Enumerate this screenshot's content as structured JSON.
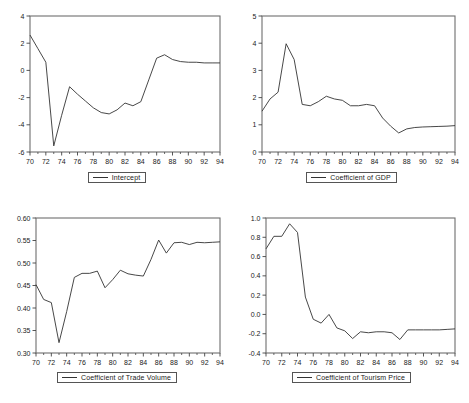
{
  "figure": {
    "layout": "2x2 grid of line charts",
    "panels": [
      "intercept",
      "gdp",
      "trade_volume",
      "tourism_price"
    ]
  },
  "chart_data": [
    {
      "id": "intercept",
      "type": "line",
      "title": "",
      "xlabel": "",
      "ylabel": "",
      "legend": "Intercept",
      "legend_position": "bottom-center",
      "grid": false,
      "xlim": [
        70,
        94
      ],
      "ylim": [
        -6,
        4
      ],
      "yticks": [
        -6,
        -4,
        -2,
        0,
        2,
        4
      ],
      "ytick_labels": [
        "-6",
        "-4",
        "-2",
        "0",
        "2",
        "4"
      ],
      "xticks": [
        70,
        72,
        74,
        76,
        78,
        80,
        82,
        84,
        86,
        88,
        90,
        92,
        94
      ],
      "xtick_labels": [
        "70",
        "72",
        "74",
        "76",
        "78",
        "80",
        "82",
        "84",
        "86",
        "88",
        "90",
        "92",
        "94"
      ],
      "x": [
        70,
        71,
        72,
        73,
        74,
        75,
        76,
        77,
        78,
        79,
        80,
        81,
        82,
        83,
        84,
        85,
        86,
        87,
        88,
        89,
        90,
        91,
        92,
        93,
        94
      ],
      "values": [
        2.6,
        1.6,
        0.6,
        -5.55,
        -3.3,
        -1.2,
        -1.75,
        -2.25,
        -2.75,
        -3.1,
        -3.2,
        -2.9,
        -2.4,
        -2.6,
        -2.3,
        -0.7,
        0.9,
        1.15,
        0.8,
        0.65,
        0.6,
        0.6,
        0.55,
        0.55,
        0.55
      ]
    },
    {
      "id": "gdp",
      "type": "line",
      "title": "",
      "xlabel": "",
      "ylabel": "",
      "legend": "Coefficient of GDP",
      "legend_position": "bottom-center",
      "grid": false,
      "xlim": [
        70,
        94
      ],
      "ylim": [
        0,
        5
      ],
      "yticks": [
        0,
        1,
        2,
        3,
        4,
        5
      ],
      "ytick_labels": [
        "0",
        "1",
        "2",
        "3",
        "4",
        "5"
      ],
      "xticks": [
        70,
        72,
        74,
        76,
        78,
        80,
        82,
        84,
        86,
        88,
        90,
        92,
        94
      ],
      "xtick_labels": [
        "70",
        "72",
        "74",
        "76",
        "78",
        "80",
        "82",
        "84",
        "86",
        "88",
        "90",
        "92",
        "94"
      ],
      "x": [
        70,
        71,
        72,
        73,
        74,
        75,
        76,
        77,
        78,
        79,
        80,
        81,
        82,
        83,
        84,
        85,
        86,
        87,
        88,
        89,
        90,
        91,
        92,
        93,
        94
      ],
      "values": [
        1.5,
        1.95,
        2.2,
        3.98,
        3.4,
        1.75,
        1.7,
        1.85,
        2.05,
        1.95,
        1.9,
        1.7,
        1.7,
        1.75,
        1.7,
        1.25,
        0.95,
        0.7,
        0.85,
        0.9,
        0.92,
        0.93,
        0.94,
        0.95,
        0.97
      ]
    },
    {
      "id": "trade_volume",
      "type": "line",
      "title": "",
      "xlabel": "",
      "ylabel": "",
      "legend": "Coefficient of Trade Volume",
      "legend_position": "bottom-center",
      "grid": false,
      "xlim": [
        70,
        94
      ],
      "ylim": [
        0.3,
        0.6
      ],
      "yticks": [
        0.3,
        0.35,
        0.4,
        0.45,
        0.5,
        0.55,
        0.6
      ],
      "ytick_labels": [
        "0.30",
        "0.35",
        "0.40",
        "0.45",
        "0.50",
        "0.55",
        "0.60"
      ],
      "xticks": [
        70,
        72,
        74,
        76,
        78,
        80,
        82,
        84,
        86,
        88,
        90,
        92,
        94
      ],
      "xtick_labels": [
        "70",
        "72",
        "74",
        "76",
        "78",
        "80",
        "82",
        "84",
        "86",
        "88",
        "90",
        "92",
        "94"
      ],
      "x": [
        70,
        71,
        72,
        73,
        74,
        75,
        76,
        77,
        78,
        79,
        80,
        81,
        82,
        83,
        84,
        85,
        86,
        87,
        88,
        89,
        90,
        91,
        92,
        93,
        94
      ],
      "values": [
        0.452,
        0.419,
        0.412,
        0.323,
        0.392,
        0.468,
        0.477,
        0.477,
        0.482,
        0.445,
        0.463,
        0.484,
        0.476,
        0.473,
        0.471,
        0.508,
        0.551,
        0.522,
        0.545,
        0.546,
        0.541,
        0.546,
        0.545,
        0.546,
        0.547
      ]
    },
    {
      "id": "tourism_price",
      "type": "line",
      "title": "",
      "xlabel": "",
      "ylabel": "",
      "legend": "Coefficient of Tourism Price",
      "legend_position": "bottom-center",
      "grid": false,
      "xlim": [
        70,
        94
      ],
      "ylim": [
        -0.4,
        1.0
      ],
      "yticks": [
        -0.4,
        -0.2,
        0.0,
        0.2,
        0.4,
        0.6,
        0.8,
        1.0
      ],
      "ytick_labels": [
        "-0.4",
        "-0.2",
        "0.0",
        "0.2",
        "0.4",
        "0.6",
        "0.8",
        "1.0"
      ],
      "xticks": [
        70,
        72,
        74,
        76,
        78,
        80,
        82,
        84,
        86,
        88,
        90,
        92,
        94
      ],
      "xtick_labels": [
        "70",
        "72",
        "74",
        "76",
        "78",
        "80",
        "82",
        "84",
        "86",
        "88",
        "90",
        "92",
        "94"
      ],
      "x": [
        70,
        71,
        72,
        73,
        74,
        75,
        76,
        77,
        78,
        79,
        80,
        81,
        82,
        83,
        84,
        85,
        86,
        87,
        88,
        89,
        90,
        91,
        92,
        93,
        94
      ],
      "values": [
        0.68,
        0.81,
        0.81,
        0.94,
        0.85,
        0.18,
        -0.05,
        -0.09,
        0.0,
        -0.14,
        -0.17,
        -0.25,
        -0.18,
        -0.19,
        -0.18,
        -0.18,
        -0.19,
        -0.26,
        -0.16,
        -0.16,
        -0.16,
        -0.16,
        -0.16,
        -0.155,
        -0.15
      ]
    }
  ]
}
